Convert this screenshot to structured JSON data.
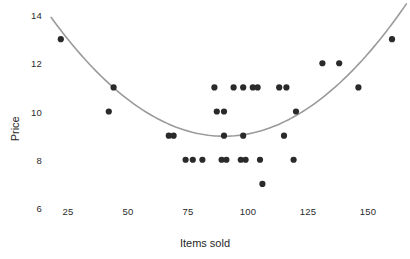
{
  "chart_data": {
    "type": "scatter",
    "title": "",
    "xlabel": "Items sold",
    "ylabel": "Price",
    "xlim": [
      15,
      168
    ],
    "ylim": [
      5.6,
      14.3
    ],
    "xticks": [
      25,
      50,
      75,
      100,
      125,
      150
    ],
    "yticks": [
      6,
      8,
      10,
      12,
      14
    ],
    "xtick_labels": [
      "25",
      "50",
      "75",
      "100",
      "125",
      "150"
    ],
    "ytick_labels": [
      "6",
      "8",
      "10",
      "12",
      "14"
    ],
    "grid": false,
    "legend": false,
    "marker_color": "#2a2a2a",
    "marker_size": 3.1,
    "points": [
      {
        "x": 22,
        "y": 13
      },
      {
        "x": 44,
        "y": 11
      },
      {
        "x": 42,
        "y": 10
      },
      {
        "x": 67,
        "y": 9
      },
      {
        "x": 69,
        "y": 9
      },
      {
        "x": 74,
        "y": 8
      },
      {
        "x": 77,
        "y": 8
      },
      {
        "x": 81,
        "y": 8
      },
      {
        "x": 86,
        "y": 11
      },
      {
        "x": 87,
        "y": 10
      },
      {
        "x": 90,
        "y": 10
      },
      {
        "x": 89,
        "y": 8
      },
      {
        "x": 91,
        "y": 8
      },
      {
        "x": 90,
        "y": 9
      },
      {
        "x": 94,
        "y": 11
      },
      {
        "x": 98,
        "y": 11
      },
      {
        "x": 97,
        "y": 8
      },
      {
        "x": 99,
        "y": 8
      },
      {
        "x": 102,
        "y": 11
      },
      {
        "x": 104,
        "y": 11
      },
      {
        "x": 98,
        "y": 9
      },
      {
        "x": 105,
        "y": 8
      },
      {
        "x": 106,
        "y": 7
      },
      {
        "x": 113,
        "y": 11
      },
      {
        "x": 116,
        "y": 11
      },
      {
        "x": 115,
        "y": 9
      },
      {
        "x": 119,
        "y": 8
      },
      {
        "x": 120,
        "y": 10
      },
      {
        "x": 131,
        "y": 12
      },
      {
        "x": 138,
        "y": 12
      },
      {
        "x": 146,
        "y": 11
      },
      {
        "x": 160,
        "y": 13
      }
    ],
    "fit_curve": {
      "kind": "quadratic",
      "color": "#9a9a9a",
      "width": 1.6,
      "description": "U-shaped quadratic regression line with minimum near x=90, y=9",
      "coefficients": {
        "a": 0.00095,
        "b": -0.171,
        "c": 16.67
      },
      "x_start": 18,
      "x_end": 166
    }
  },
  "axes": {
    "x_title": "Items sold",
    "y_title": "Price"
  }
}
